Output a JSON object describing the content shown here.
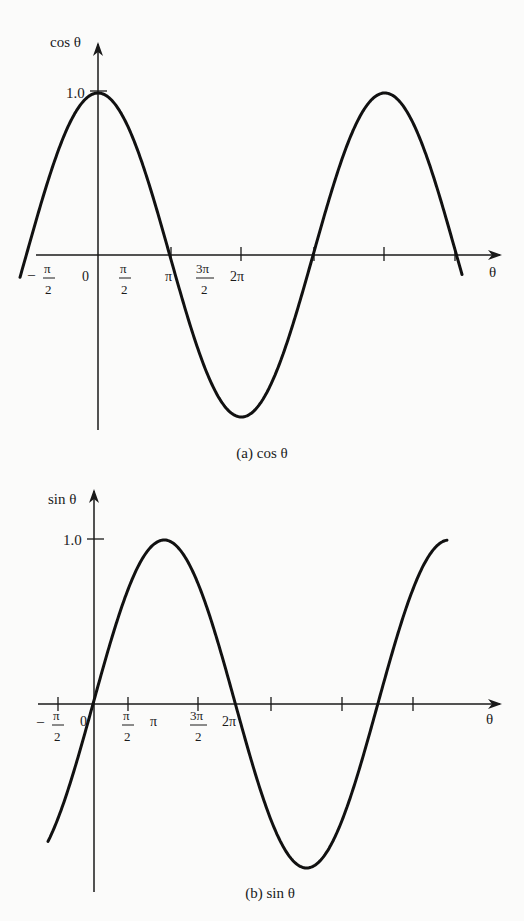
{
  "chart_data": [
    {
      "type": "line",
      "title": "(a) cos θ",
      "caption": "(a) cos θ",
      "ylabel": "cos θ",
      "xlabel": "θ",
      "function": "cos",
      "x_range_radians": [
        -3.3,
        5.5
      ],
      "ylim": [
        -1,
        1
      ],
      "y_tick_labels": [
        "1.0"
      ],
      "x_tick_labels": [
        "-π/2",
        "0",
        "π/2",
        "π",
        "3π/2",
        "2π",
        "",
        "",
        ""
      ],
      "x_ticks_radians": [
        -1.5708,
        0,
        1.5708,
        3.1416,
        4.7124,
        6.2832,
        9.4248,
        12.5664,
        15.708
      ],
      "grid": false,
      "points": [
        {
          "x": "-π",
          "y": -1
        },
        {
          "x": "-π/2",
          "y": 0
        },
        {
          "x": "0",
          "y": 1
        },
        {
          "x": "π/2",
          "y": 0
        },
        {
          "x": "π",
          "y": -1
        },
        {
          "x": "3π/2",
          "y": 0
        },
        {
          "x": "2π",
          "y": 1
        },
        {
          "x": "5π/2",
          "y": 0
        },
        {
          "x": "3π",
          "y": -1
        },
        {
          "x": "7π/2",
          "y": 0
        },
        {
          "x": "4π",
          "y": 1
        },
        {
          "x": "9π/2",
          "y": 0
        },
        {
          "x": "5π",
          "y": -1
        }
      ]
    },
    {
      "type": "line",
      "title": "(b) sin θ",
      "caption": "(b) sin θ",
      "ylabel": "sin θ",
      "xlabel": "θ",
      "function": "sin",
      "ylim": [
        -1,
        1
      ],
      "y_tick_labels": [
        "1.0"
      ],
      "x_tick_labels": [
        "-π/2",
        "0",
        "π/2",
        "π",
        "3π/2",
        "2π",
        "",
        "",
        ""
      ],
      "grid": false,
      "points": [
        {
          "x": "-π/2",
          "y": -1
        },
        {
          "x": "0",
          "y": 0
        },
        {
          "x": "π/2",
          "y": 1
        },
        {
          "x": "π",
          "y": 0
        },
        {
          "x": "3π/2",
          "y": -1
        },
        {
          "x": "2π",
          "y": 0
        },
        {
          "x": "5π/2",
          "y": 1
        },
        {
          "x": "3π",
          "y": 0
        },
        {
          "x": "7π/2",
          "y": -1
        },
        {
          "x": "4π",
          "y": 0
        },
        {
          "x": "9π/2",
          "y": 1
        },
        {
          "x": "≈4.8π",
          "y": -0.55
        }
      ]
    }
  ],
  "plots": {
    "cos": {
      "y_axis_label": "cos θ",
      "x_axis_label": "θ",
      "y_tick": "1.0",
      "caption": "(a) cos θ",
      "tick_minus": "–",
      "tick_pi_sym": "π",
      "tick_zero": "0",
      "tick_pi": "π",
      "tick_3pi": "3π",
      "tick_2pi": "2π",
      "tick_den": "2",
      "geom": {
        "ox": 98,
        "oy": 255,
        "amp": 162,
        "halfpi": 71.7,
        "x_start": 20,
        "x_end": 462,
        "phase": 0
      }
    },
    "sin": {
      "y_axis_label": "sin θ",
      "x_axis_label": "θ",
      "y_tick": "1.0",
      "caption": "(b) sin θ",
      "tick_minus": "–",
      "tick_pi_sym": "π",
      "tick_zero": "0",
      "tick_pi": "π",
      "tick_3pi": "3π",
      "tick_2pi": "2π",
      "tick_den": "2",
      "geom": {
        "ox": 93,
        "oy": 704,
        "amp": 164,
        "halfpi": 71.2,
        "x_start": 48,
        "x_end": 447,
        "phase": 1
      }
    }
  }
}
